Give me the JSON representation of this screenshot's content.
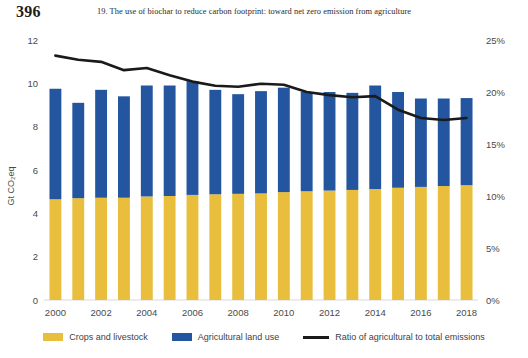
{
  "page": {
    "number": "396",
    "running_head": "19. The use of biochar to reduce carbon footprint: toward net zero emission from agriculture"
  },
  "legend": {
    "items": [
      {
        "label": "Crops and livestock",
        "marker": "square-swatch",
        "color": "#E8BE3C"
      },
      {
        "label": "Agricultural land use",
        "marker": "square-swatch",
        "color": "#2456A0"
      },
      {
        "label": "Ratio of agricultural to total emissions",
        "marker": "line-swatch",
        "color": "#1a1a1a"
      }
    ]
  },
  "chart_data": {
    "type": "bar",
    "title": "",
    "xlabel": "",
    "ylabel": "Gt CO₂eq",
    "y2label": "",
    "ylim": [
      0,
      12
    ],
    "y2lim": [
      0,
      25
    ],
    "yticks": [
      "0",
      "2",
      "4",
      "6",
      "8",
      "10",
      "12"
    ],
    "y2ticks": [
      "0%",
      "5%",
      "10%",
      "15%",
      "20%",
      "25%"
    ],
    "grid": false,
    "legend_position": "bottom",
    "stacked": true,
    "categories": [
      "2000",
      "2001",
      "2002",
      "2003",
      "2004",
      "2005",
      "2006",
      "2007",
      "2008",
      "2009",
      "2010",
      "2011",
      "2012",
      "2013",
      "2014",
      "2015",
      "2016",
      "2017",
      "2018"
    ],
    "tick_labels": [
      "2000",
      "",
      "2002",
      "",
      "2004",
      "",
      "2006",
      "",
      "2008",
      "",
      "2010",
      "",
      "2012",
      "",
      "2014",
      "",
      "2016",
      "",
      "2018"
    ],
    "series": [
      {
        "name": "Crops and livestock",
        "color": "#E8BE3C",
        "axis": "left",
        "unit": "Gt CO2eq",
        "values": [
          4.65,
          4.7,
          4.72,
          4.72,
          4.78,
          4.8,
          4.85,
          4.88,
          4.9,
          4.92,
          4.98,
          5.02,
          5.05,
          5.08,
          5.12,
          5.18,
          5.22,
          5.26,
          5.3
        ]
      },
      {
        "name": "Agricultural land use",
        "color": "#2456A0",
        "axis": "left",
        "unit": "Gt CO2eq",
        "values": [
          5.1,
          4.4,
          4.98,
          4.68,
          5.12,
          5.1,
          5.25,
          4.82,
          4.6,
          4.72,
          4.82,
          4.58,
          4.55,
          4.48,
          4.78,
          4.42,
          4.08,
          4.04,
          4.02
        ]
      },
      {
        "name": "Ratio of agricultural to total emissions",
        "color": "#1a1a1a",
        "axis": "right",
        "unit": "%",
        "type": "line",
        "values": [
          23.5,
          23.1,
          22.9,
          22.1,
          22.3,
          21.6,
          21.0,
          20.6,
          20.5,
          20.8,
          20.7,
          20.0,
          19.7,
          19.5,
          19.6,
          18.3,
          17.5,
          17.3,
          17.5
        ]
      }
    ]
  }
}
